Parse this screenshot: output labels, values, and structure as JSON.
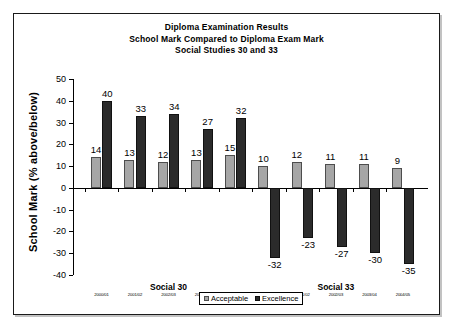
{
  "chart_data": {
    "type": "bar",
    "title": "Diploma Examination Results",
    "subtitle": "School Mark Compared to Diploma Exam Mark",
    "subtitle2": "Social Studies 30 and 33",
    "xlabel": "",
    "ylabel": "School Mark (% above/below)",
    "ylim": [
      -40,
      50
    ],
    "ytick_step": 10,
    "yticks": [
      "50",
      "40",
      "30",
      "20",
      "10",
      "0",
      "-10",
      "-20",
      "-30",
      "-40"
    ],
    "grid": false,
    "legend_position": "bottom-center",
    "categories": [
      "2000/01",
      "2001/02",
      "2002/03",
      "2003/04",
      "2004/05",
      "2000/01",
      "2001/02",
      "2002/03",
      "2003/04",
      "2004/05"
    ],
    "groups": [
      {
        "label": "Social 30",
        "start_index": 0,
        "end_index": 4
      },
      {
        "label": "Social 33",
        "start_index": 5,
        "end_index": 9
      }
    ],
    "series": [
      {
        "name": "Acceptable",
        "color": "#a6a6a6",
        "values": [
          14,
          13,
          12,
          13,
          15,
          10,
          12,
          11,
          11,
          9
        ]
      },
      {
        "name": "Excellence",
        "color": "#2b2b2b",
        "values": [
          40,
          33,
          34,
          27,
          32,
          -32,
          -23,
          -27,
          -30,
          -35
        ]
      }
    ]
  },
  "legend": {
    "items": [
      {
        "label": "Acceptable",
        "swatch": "acceptable"
      },
      {
        "label": "Excellence",
        "swatch": "excellence"
      }
    ]
  }
}
